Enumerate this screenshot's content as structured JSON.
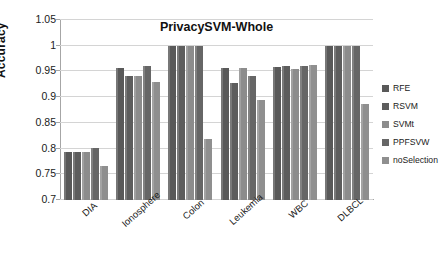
{
  "chart_data": {
    "type": "bar",
    "title": "PrivacySVM-Whole",
    "xlabel": "",
    "ylabel": "Accuracy",
    "ylim": [
      0.7,
      1.05
    ],
    "yticks": [
      "0.7",
      "0.75",
      "0.8",
      "0.85",
      "0.9",
      "0.95",
      "1",
      "1.05"
    ],
    "ytick_values": [
      0.7,
      0.75,
      0.8,
      0.85,
      0.9,
      0.95,
      1.0,
      1.05
    ],
    "grid": true,
    "legend_position": "right",
    "categories": [
      "DIA",
      "Ionosphere",
      "Colon",
      "Leukemia",
      "WBC",
      "DLBCL"
    ],
    "series": [
      {
        "name": "RFE",
        "color": "#595959",
        "values": [
          0.794,
          0.956,
          1.0,
          0.956,
          0.959,
          0.999
        ]
      },
      {
        "name": "RSVM",
        "color": "#5d5d5d",
        "values": [
          0.794,
          0.941,
          1.0,
          0.928,
          0.961,
          0.999
        ]
      },
      {
        "name": "SVMt",
        "color": "#8c8c8c",
        "values": [
          0.794,
          0.942,
          1.0,
          0.956,
          0.955,
          0.999
        ]
      },
      {
        "name": "PPFSVW",
        "color": "#666666",
        "values": [
          0.801,
          0.961,
          1.0,
          0.941,
          0.96,
          0.999
        ]
      },
      {
        "name": "noSelection",
        "color": "#8f8f8f",
        "values": [
          0.766,
          0.929,
          0.818,
          0.894,
          0.963,
          0.887
        ]
      }
    ]
  }
}
